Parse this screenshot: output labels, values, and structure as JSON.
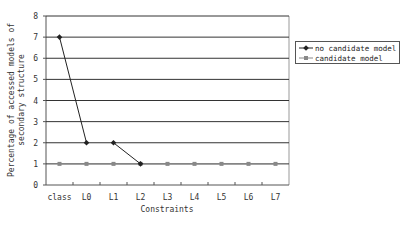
{
  "chart_data": {
    "type": "line",
    "title": "",
    "xlabel": "Constraints",
    "ylabel": "Percentage of accessed models of secondary structure",
    "ylabel_lines": [
      "Percentage of accessed models of",
      "secondary structure"
    ],
    "categories": [
      "class",
      "L0",
      "L1",
      "L2",
      "L3",
      "L4",
      "L5",
      "L6",
      "L7"
    ],
    "ylim": [
      0,
      8
    ],
    "yticks": [
      0,
      1,
      2,
      3,
      4,
      5,
      6,
      7,
      8
    ],
    "grid": true,
    "legend_position": "right",
    "series": [
      {
        "name": "no candidate model",
        "values": [
          7,
          2,
          2,
          1,
          null,
          null,
          null,
          null,
          null
        ],
        "segments": [
          [
            0,
            1
          ],
          [
            2,
            3
          ]
        ],
        "color": "#222222",
        "marker": "diamond"
      },
      {
        "name": "candidate model",
        "values": [
          1,
          1,
          1,
          1,
          1,
          1,
          1,
          1,
          1
        ],
        "color": "#888888",
        "marker": "square"
      }
    ]
  },
  "legend": {
    "items": [
      {
        "label": "no candidate model"
      },
      {
        "label": "candidate model"
      }
    ]
  }
}
